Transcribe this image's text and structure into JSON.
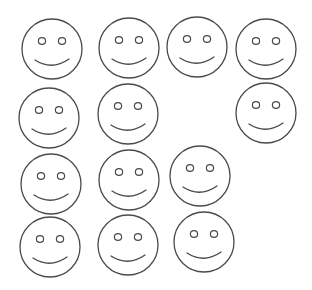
{
  "figure": {
    "count": 13,
    "stroke_color": "#4a4a4a",
    "background": "#ffffff",
    "face_radius": 30,
    "faces": [
      {
        "id": 1,
        "row": 1,
        "cx": 52,
        "cy": 49
      },
      {
        "id": 2,
        "row": 1,
        "cx": 129,
        "cy": 48
      },
      {
        "id": 3,
        "row": 1,
        "cx": 197,
        "cy": 47
      },
      {
        "id": 4,
        "row": 1,
        "cx": 266,
        "cy": 49
      },
      {
        "id": 5,
        "row": 2,
        "cx": 49,
        "cy": 118
      },
      {
        "id": 6,
        "row": 2,
        "cx": 128,
        "cy": 114
      },
      {
        "id": 7,
        "row": 2,
        "cx": 266,
        "cy": 113
      },
      {
        "id": 8,
        "row": 3,
        "cx": 51,
        "cy": 184
      },
      {
        "id": 9,
        "row": 3,
        "cx": 129,
        "cy": 180
      },
      {
        "id": 10,
        "row": 3,
        "cx": 200,
        "cy": 176
      },
      {
        "id": 11,
        "row": 4,
        "cx": 50,
        "cy": 247
      },
      {
        "id": 12,
        "row": 4,
        "cx": 128,
        "cy": 245
      },
      {
        "id": 13,
        "row": 4,
        "cx": 204,
        "cy": 242
      }
    ]
  }
}
